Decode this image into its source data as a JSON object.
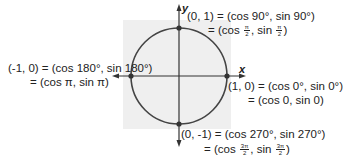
{
  "diagram": {
    "type": "unit-circle",
    "axes": {
      "x_label": "x",
      "y_label": "y"
    },
    "points": [
      {
        "id": "top",
        "line1": "(0, 1) = (cos 90°, sin 90°)",
        "line2_prefix": "= (cos ",
        "line2_frac1": {
          "num": "π",
          "den": "2"
        },
        "line2_mid": ", sin ",
        "line2_frac2": {
          "num": "π",
          "den": "2"
        },
        "line2_suffix": ")"
      },
      {
        "id": "left",
        "line1": "(-1, 0) = (cos 180°, sin 180°)",
        "line2": "= (cos π, sin π)"
      },
      {
        "id": "right",
        "line1": "(1, 0) = (cos 0°, sin 0°)",
        "line2": "= (cos 0, sin 0)"
      },
      {
        "id": "bottom",
        "line1": "(0, -1) = (cos 270°, sin 270°)",
        "line2_prefix": "= (cos ",
        "line2_frac1": {
          "num": "3π",
          "den": "2"
        },
        "line2_mid": ", sin ",
        "line2_frac2": {
          "num": "3π",
          "den": "2"
        },
        "line2_suffix": ")"
      }
    ],
    "colors": {
      "background_square": "#efefef",
      "stroke": "#333333",
      "text": "#222222"
    }
  }
}
